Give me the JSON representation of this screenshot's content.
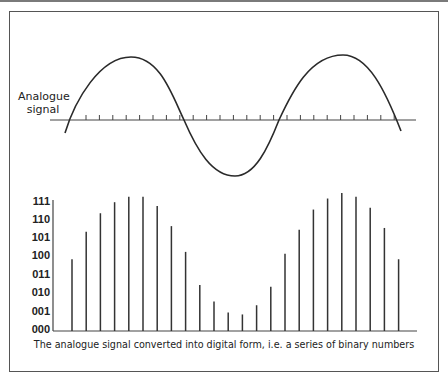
{
  "diagram": {
    "analogue_label_line1": "Analogue",
    "analogue_label_line2": "signal",
    "caption": "The analogue signal converted into digital form, i.e. a series of binary numbers",
    "line_color": "#333333",
    "y_labels": [
      "111",
      "110",
      "101",
      "100",
      "011",
      "010",
      "001",
      "000"
    ]
  },
  "chart_data": {
    "type": "bar",
    "title": "The analogue signal converted into digital form, i.e. a series of binary numbers",
    "xlabel": "",
    "ylabel": "",
    "y_tick_labels": [
      "000",
      "001",
      "010",
      "011",
      "100",
      "101",
      "110",
      "111"
    ],
    "ylim": [
      0,
      7
    ],
    "categories": [
      1,
      2,
      3,
      4,
      5,
      6,
      7,
      8,
      9,
      10,
      11,
      12,
      13,
      14,
      15,
      16,
      17,
      18,
      19,
      20,
      21,
      22,
      23,
      24
    ],
    "values": [
      3.9,
      5.4,
      6.4,
      7.0,
      7.3,
      7.3,
      6.8,
      5.7,
      4.3,
      2.5,
      1.6,
      1.0,
      0.9,
      1.4,
      2.4,
      4.2,
      5.5,
      6.6,
      7.2,
      7.5,
      7.3,
      6.7,
      5.6,
      3.9
    ],
    "grid": false,
    "legend": "none"
  }
}
